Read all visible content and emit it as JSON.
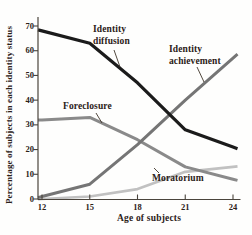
{
  "chart_data": {
    "type": "line",
    "x_label": "Age of subjects",
    "y_label": "Percentage of subjects in each identity status",
    "x": [
      12,
      15,
      18,
      21,
      24
    ],
    "xticks": [
      12,
      15,
      18,
      21,
      24
    ],
    "yticks": [
      0,
      10,
      20,
      30,
      40,
      50,
      60,
      70
    ],
    "ylim": [
      0,
      70
    ],
    "xlim": [
      12,
      24
    ],
    "grid": false,
    "legend_position": "inline-annotations",
    "axis_color": "#4a443c",
    "series": [
      {
        "name": "Moratorium",
        "values": [
          0,
          1,
          4,
          11,
          13
        ],
        "color": "#c1c1c1",
        "stroke_width": 2.7
      },
      {
        "name": "Foreclosure",
        "values": [
          32,
          33,
          24,
          13,
          8
        ],
        "color": "#8a8a8a",
        "stroke_width": 3.0
      },
      {
        "name": "Identity achievement",
        "values": [
          1,
          6,
          22,
          40,
          57
        ],
        "color": "#757575",
        "stroke_width": 3.0
      },
      {
        "name": "Identity diffusion",
        "values": [
          68,
          63,
          47,
          28,
          21
        ],
        "color": "#1b1b1b",
        "stroke_width": 3.2
      }
    ],
    "annotations": [
      {
        "line1": "Identity",
        "line2": "diffusion",
        "x": 93,
        "y": 24,
        "leader": [
          114,
          50,
          120,
          67
        ]
      },
      {
        "line1": "Identity",
        "line2": "achievement",
        "x": 169,
        "y": 44,
        "leader": [
          197,
          67,
          204,
          82
        ]
      },
      {
        "line1": "Foreclosure",
        "line2": "",
        "x": 63,
        "y": 101,
        "leader": [
          96,
          113,
          102,
          123
        ]
      },
      {
        "line1": "Moratorium",
        "line2": "",
        "x": 152,
        "y": 173,
        "leader": [
          159,
          173,
          154,
          168
        ]
      }
    ],
    "leader_color": "#40352a"
  }
}
